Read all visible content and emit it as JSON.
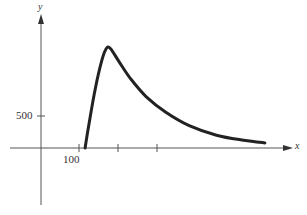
{
  "chart_data": {
    "type": "line",
    "title": "",
    "xlabel": "x",
    "ylabel": "y",
    "x_ticks": [
      100,
      200,
      300
    ],
    "x_tick_labels": [
      "100"
    ],
    "y_ticks": [
      500
    ],
    "y_tick_labels": [
      "500"
    ],
    "grid": false,
    "legend": null,
    "series": [
      {
        "name": "curve",
        "x": [
          113,
          125,
          140,
          155,
          165,
          172,
          180,
          200,
          230,
          270,
          320,
          380,
          450,
          520,
          574
        ],
        "y": [
          0,
          450,
          950,
          1350,
          1530,
          1580,
          1540,
          1350,
          1080,
          800,
          560,
          350,
          200,
          120,
          80
        ]
      }
    ],
    "color": "#222222"
  },
  "axes": {
    "x_label": "x",
    "y_label": "y",
    "tick_x_label": "100",
    "tick_y_label": "500"
  }
}
